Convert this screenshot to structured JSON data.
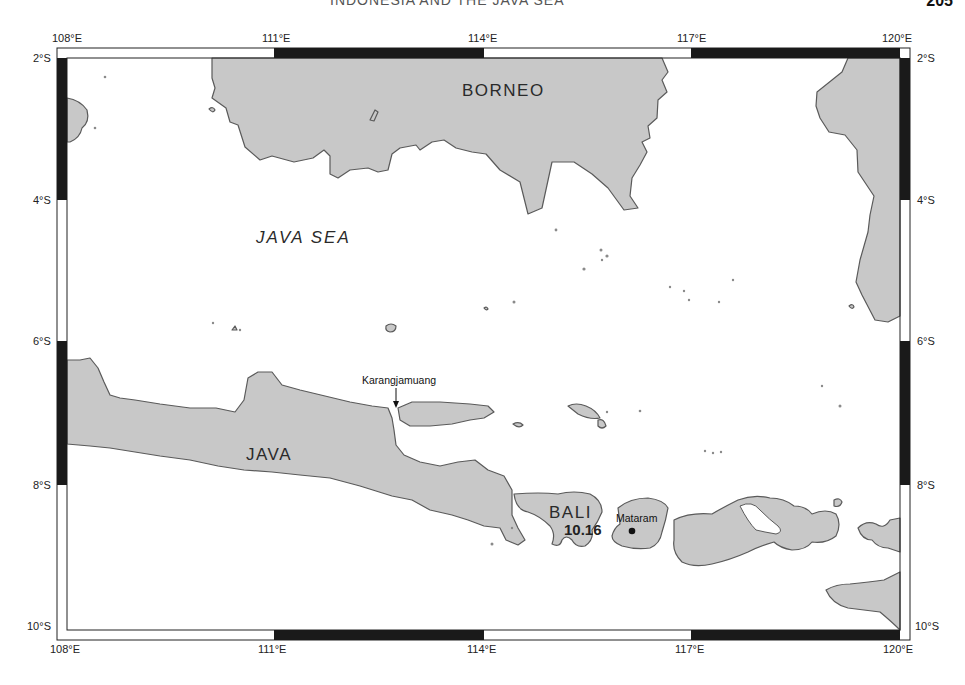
{
  "page": {
    "running_title": "INDONESIA AND THE JAVA SEA",
    "page_number": "205"
  },
  "map": {
    "frame": {
      "top_labels": [
        "108°E",
        "111°E",
        "114°E",
        "117°E",
        "120°E"
      ],
      "bottom_labels": [
        "108°E",
        "111°E",
        "114°E",
        "117°E",
        "120°E"
      ],
      "left_labels": [
        "2°S",
        "4°S",
        "6°S",
        "8°S",
        "10°S"
      ],
      "right_labels": [
        "2°S",
        "4°S",
        "6°S",
        "8°S",
        "10°S"
      ]
    },
    "regions": {
      "borneo": "BORNEO",
      "java": "JAVA",
      "bali": "BALI",
      "java_sea": "JAVA SEA"
    },
    "places": {
      "karangjamuang": "Karangjamuang",
      "mataram": "Mataram"
    },
    "annotations": {
      "bali_value": "10.16"
    },
    "colors": {
      "land": "#c8c8c8",
      "coast": "#5a5a5a",
      "frame_dark": "#1a1a1a",
      "sea": "#ffffff"
    }
  }
}
